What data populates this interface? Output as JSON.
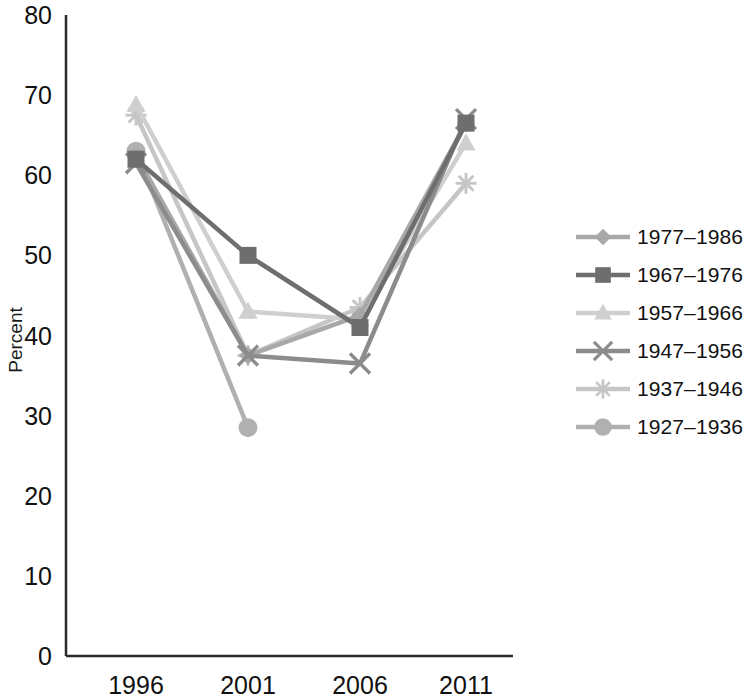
{
  "chart_data": {
    "type": "line",
    "title": "",
    "xlabel": "",
    "ylabel": "Percent",
    "categories": [
      "1996",
      "2001",
      "2006",
      "2011"
    ],
    "x_tick_labels": [
      "1996",
      "2001",
      "2006",
      "2011"
    ],
    "y_tick_labels": [
      "0",
      "10",
      "20",
      "30",
      "40",
      "50",
      "60",
      "70",
      "80"
    ],
    "y_tick_values": [
      0,
      10,
      20,
      30,
      40,
      50,
      60,
      70,
      80
    ],
    "ylim": [
      0,
      80
    ],
    "grid": false,
    "legend_position": "right",
    "series": [
      {
        "name": "1977–1986",
        "marker": "diamond",
        "color": "#a8a8a8",
        "values": [
          62.5,
          37.5,
          42.5,
          66.5
        ]
      },
      {
        "name": "1967–1976",
        "marker": "square",
        "color": "#6e6e6e",
        "values": [
          62.0,
          50.0,
          41.0,
          66.5
        ]
      },
      {
        "name": "1957–1966",
        "marker": "triangle",
        "color": "#cfcfcf",
        "values": [
          68.8,
          43.0,
          42.0,
          64.0
        ]
      },
      {
        "name": "1947–1956",
        "marker": "x",
        "color": "#8c8c8c",
        "values": [
          61.5,
          37.5,
          36.5,
          67.0
        ]
      },
      {
        "name": "1937–1946",
        "marker": "star",
        "color": "#c6c6c6",
        "values": [
          67.5,
          37.5,
          43.5,
          59.0
        ]
      },
      {
        "name": "1927–1936",
        "marker": "circle",
        "color": "#b0b0b0",
        "values": [
          63.0,
          28.5,
          null,
          null
        ]
      }
    ]
  },
  "axis": {
    "y_title": "Percent"
  }
}
